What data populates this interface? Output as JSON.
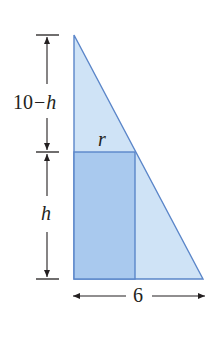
{
  "diagram": {
    "type": "geometry-figure",
    "colors": {
      "triangle_fill": "#cfe3f6",
      "rectangle_fill": "#a9c9ee",
      "edge": "#5b86c9",
      "text": "#231f20"
    },
    "labels": {
      "upper_height": "10 − h",
      "upper_height_num": "10",
      "upper_height_minus": "−",
      "upper_height_var": "h",
      "lower_height": "h",
      "rect_width": "r",
      "base": "6"
    },
    "shapes": {
      "triangle": {
        "points": [
          [
            74,
            35
          ],
          [
            74,
            279
          ],
          [
            203,
            279
          ]
        ]
      },
      "rectangle": {
        "x": 74,
        "y": 152,
        "width": 61,
        "height": 127
      }
    },
    "dimensions": {
      "vertical_upper": {
        "from": 35,
        "to": 152,
        "label": "10 − h"
      },
      "vertical_lower": {
        "from": 152,
        "to": 279,
        "label": "h"
      },
      "horizontal": {
        "from": 74,
        "to": 203,
        "label": "6"
      }
    }
  }
}
